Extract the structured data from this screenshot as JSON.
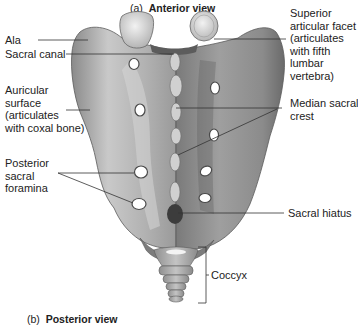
{
  "titles": {
    "top": {
      "prefix": "(a)",
      "name": "Anterior view"
    },
    "bottom": {
      "prefix": "(b)",
      "name": "Posterior view"
    }
  },
  "labels": {
    "ala": "Ala",
    "sacral_canal": "Sacral canal",
    "auricular": [
      "Auricular",
      "surface",
      "(articulates",
      "with coxal bone)"
    ],
    "posterior_foramina": [
      "Posterior",
      "sacral",
      "foramina"
    ],
    "superior_facet": [
      "Superior",
      "articular facet",
      "(articulates",
      "with fifth",
      "lumbar",
      "vertebra)"
    ],
    "median_crest": [
      "Median sacral",
      "crest"
    ],
    "sacral_hiatus": "Sacral hiatus",
    "coccyx": "Coccyx"
  },
  "colors": {
    "bone_light": "#d9d9d9",
    "bone_mid": "#a8a8a8",
    "bone_dark": "#6e6e6e",
    "line": "#333333"
  }
}
